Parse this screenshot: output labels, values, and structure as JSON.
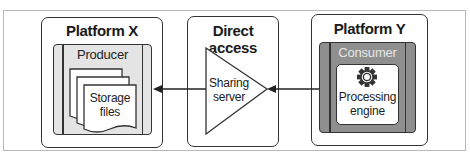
{
  "diagram": {
    "type": "architecture-flow",
    "colors": {
      "stroke": "#333333",
      "producer_fill": "#e4e4e4",
      "consumer_fill": "#8f8f8f",
      "consumer_label": "#e6e6e6",
      "background": "#ffffff"
    },
    "platform_x": {
      "title": "Platform X",
      "producer": {
        "label": "Producer",
        "storage": {
          "line1": "Storage",
          "line2": "files"
        }
      }
    },
    "direct_access": {
      "title": "Direct access",
      "sharing_server": {
        "line1": "Sharing",
        "line2": "server"
      }
    },
    "platform_y": {
      "title": "Platform Y",
      "consumer": {
        "label": "Consumer",
        "engine": {
          "icon": "gear-icon",
          "line1": "Processing",
          "line2": "engine"
        }
      }
    },
    "edges": [
      {
        "from": "Processing engine (Consumer)",
        "to": "Sharing server",
        "direction": "right-to-left"
      },
      {
        "from": "Sharing server",
        "to": "Producer",
        "direction": "right-to-left"
      }
    ]
  }
}
